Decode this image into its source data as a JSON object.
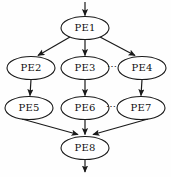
{
  "diagram": {
    "background_color": "#fefefe",
    "stroke_color": "#1a1a1a",
    "node_fill_color": "#ffffff",
    "label_color": "#111111",
    "nodes": [
      {
        "id": "PE1",
        "label": "PE1",
        "cx": 85,
        "cy": 28,
        "rx": 24,
        "ry": 11.5
      },
      {
        "id": "PE2",
        "label": "PE2",
        "cx": 31,
        "cy": 68,
        "rx": 24,
        "ry": 11.5
      },
      {
        "id": "PE3",
        "label": "PE3",
        "cx": 85,
        "cy": 68,
        "rx": 24,
        "ry": 11.5
      },
      {
        "id": "PE4",
        "label": "PE4",
        "cx": 142,
        "cy": 68,
        "rx": 24,
        "ry": 11.5
      },
      {
        "id": "PE5",
        "label": "PE5",
        "cx": 29,
        "cy": 108,
        "rx": 24,
        "ry": 11.5
      },
      {
        "id": "PE6",
        "label": "PE6",
        "cx": 85,
        "cy": 108,
        "rx": 24,
        "ry": 11.5
      },
      {
        "id": "PE7",
        "label": "PE7",
        "cx": 141,
        "cy": 108,
        "rx": 24,
        "ry": 11.5
      },
      {
        "id": "PE8",
        "label": "PE8",
        "cx": 85,
        "cy": 148,
        "rx": 24,
        "ry": 11.5
      }
    ],
    "ellipses_markers": [
      {
        "id": "row2-ellipsis",
        "label": "⋯",
        "x": 112,
        "y": 67
      },
      {
        "id": "row3-ellipsis",
        "label": "⋯",
        "x": 111,
        "y": 107
      }
    ],
    "edges": [
      {
        "id": "entry-to-pe1",
        "from": "entry",
        "to": "PE1"
      },
      {
        "id": "pe1-to-pe2",
        "from": "PE1",
        "to": "PE2"
      },
      {
        "id": "pe1-to-pe3",
        "from": "PE1",
        "to": "PE3"
      },
      {
        "id": "pe1-to-pe4",
        "from": "PE1",
        "to": "PE4"
      },
      {
        "id": "pe2-to-pe5",
        "from": "PE2",
        "to": "PE5"
      },
      {
        "id": "pe3-to-pe6",
        "from": "PE3",
        "to": "PE6"
      },
      {
        "id": "pe4-to-pe7",
        "from": "PE4",
        "to": "PE7"
      },
      {
        "id": "pe5-to-pe8",
        "from": "PE5",
        "to": "PE8"
      },
      {
        "id": "pe6-to-pe8",
        "from": "PE6",
        "to": "PE8"
      },
      {
        "id": "pe7-to-pe8",
        "from": "PE7",
        "to": "PE8"
      },
      {
        "id": "pe8-to-exit",
        "from": "PE8",
        "to": "exit"
      }
    ]
  }
}
